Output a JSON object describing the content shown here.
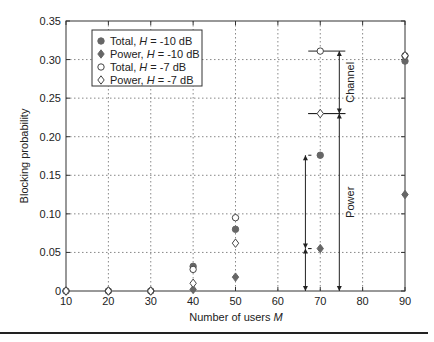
{
  "chart_data": {
    "type": "scatter",
    "title": "",
    "xlabel": "Number of users M",
    "xlabel_text": "Number of users ",
    "xlabel_var": "M",
    "ylabel": "Blocking probability",
    "xlim": [
      10,
      90
    ],
    "ylim": [
      0,
      0.35
    ],
    "grid": true,
    "legend_position": "upper left",
    "x_ticks": [
      "10",
      "20",
      "30",
      "40",
      "50",
      "60",
      "70",
      "80",
      "90"
    ],
    "y_ticks": [
      "0",
      "0.05",
      "0.10",
      "0.15",
      "0.20",
      "0.25",
      "0.30",
      "0.35"
    ],
    "series": [
      {
        "name": "Total, H = -10 dB",
        "label_pre": "Total, ",
        "label_var": "H",
        "label_post": " = -10 dB",
        "marker": "filled-circle",
        "x": [
          10,
          20,
          30,
          40,
          50,
          70,
          90
        ],
        "values": [
          0,
          0,
          0,
          0.032,
          0.08,
          0.176,
          0.298
        ]
      },
      {
        "name": "Power, H = -10 dB",
        "label_pre": "Power, ",
        "label_var": "H",
        "label_post": " = -10 dB",
        "marker": "filled-diamond",
        "x": [
          10,
          20,
          30,
          40,
          50,
          70,
          90
        ],
        "values": [
          0,
          0,
          0,
          0.002,
          0.018,
          0.055,
          0.125
        ]
      },
      {
        "name": "Total, H = -7 dB",
        "label_pre": "Total, ",
        "label_var": "H",
        "label_post": " = -7 dB",
        "marker": "open-circle",
        "x": [
          10,
          20,
          30,
          40,
          50,
          70,
          90
        ],
        "values": [
          0,
          0,
          0,
          0.028,
          0.095,
          0.311,
          0.305
        ]
      },
      {
        "name": "Power, H = -7 dB",
        "label_pre": "Power, ",
        "label_var": "H",
        "label_post": " = -7 dB",
        "marker": "open-diamond",
        "x": [
          10,
          20,
          30,
          40,
          50,
          70,
          90
        ],
        "values": [
          0,
          0,
          0,
          0.01,
          0.062,
          0.23,
          0.305
        ]
      }
    ],
    "annotations": [
      {
        "text": "Channel",
        "type": "double-arrow",
        "x": 74.5,
        "y_from": 0.23,
        "y_to": 0.311
      },
      {
        "text": "Power",
        "type": "double-arrow",
        "x": 74.5,
        "y_from": 0,
        "y_to": 0.23
      },
      {
        "text": "",
        "type": "double-arrow",
        "x": 66.5,
        "y_from": 0.055,
        "y_to": 0.176
      },
      {
        "text": "",
        "type": "double-arrow",
        "x": 66.5,
        "y_from": 0,
        "y_to": 0.055
      }
    ]
  }
}
